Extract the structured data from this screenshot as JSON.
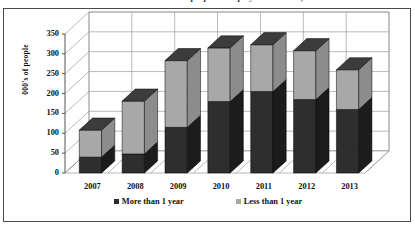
{
  "title": {
    "text": "Number of people unemployed in Britain, 2007-2013",
    "cropped": true
  },
  "chart_data": {
    "type": "bar",
    "subtype": "stacked-column-3d",
    "title": "Number of people unemployed in Britain, 2007-2013",
    "xlabel": "",
    "ylabel": "000's of people",
    "categories": [
      "2007",
      "2008",
      "2009",
      "2010",
      "2011",
      "2012",
      "2013"
    ],
    "series": [
      {
        "name": "More than 1 year",
        "color": "#2e2e2e",
        "values": [
          40,
          48,
          115,
          180,
          205,
          185,
          160
        ]
      },
      {
        "name": "Less than 1 year",
        "color": "#a8a8a8",
        "values": [
          68,
          133,
          168,
          135,
          118,
          123,
          100
        ]
      }
    ],
    "totals": [
      108,
      181,
      283,
      315,
      323,
      308,
      260
    ],
    "ylim": [
      0,
      350
    ],
    "ytick_step": 50,
    "yticks": [
      "350",
      "300",
      "250",
      "200",
      "150",
      "100",
      "50",
      "0"
    ],
    "grid": true,
    "legend_position": "bottom"
  },
  "axis": {
    "y_title": "000's of people",
    "y_ticks": [
      "350",
      "300",
      "250",
      "200",
      "150",
      "100",
      "50",
      "0"
    ],
    "x_ticks": [
      "2007",
      "2008",
      "2009",
      "2010",
      "2011",
      "2012",
      "2013"
    ]
  },
  "legend": {
    "entries": [
      {
        "label": "More than 1 year",
        "color": "#2e2e2e"
      },
      {
        "label": "Less than 1 year",
        "color": "#a8a8a8"
      }
    ]
  },
  "colors": {
    "series_dark": "#2e2e2e",
    "series_light": "#a8a8a8",
    "series_dark_side": "#1c1c1c",
    "series_light_side": "#8c8c8c",
    "series_dark_top": "#3c3c3c",
    "series_light_top": "#c2c2c2",
    "grid": "#9a9a9a",
    "axis": "#555555",
    "frame": "#4a4a4a",
    "background": "#ffffff"
  }
}
